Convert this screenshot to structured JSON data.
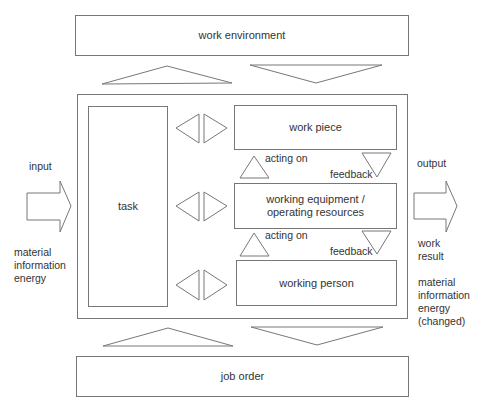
{
  "diagram": {
    "work_environment": "work environment",
    "job_order": "job order",
    "task": "task",
    "work_piece": "work piece",
    "working_equipment": "working equipment / operating resources",
    "working_equipment_line1": "working equipment /",
    "working_equipment_line2": "operating resources",
    "working_person": "working person",
    "acting_on_upper": "acting on",
    "acting_on_lower": "acting on",
    "feedback_upper": "feedback",
    "feedback_lower": "feedback",
    "input": {
      "label": "input",
      "items": [
        "material",
        "information",
        "energy"
      ]
    },
    "output": {
      "label": "output",
      "work_result_line1": "work",
      "work_result_line2": "result",
      "items": [
        "material",
        "information",
        "energy",
        "(changed)"
      ]
    }
  }
}
